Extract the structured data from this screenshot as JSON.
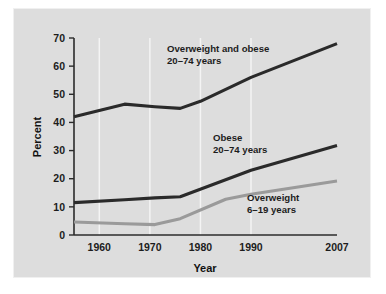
{
  "figure": {
    "background_color": "#ffffff",
    "panel_color": "#dddddd"
  },
  "chart_data": {
    "type": "line",
    "title": "",
    "xlabel": "Year",
    "ylabel": "Percent",
    "xlim": [
      1955,
      2007
    ],
    "ylim": [
      0,
      70
    ],
    "grid": "vertical",
    "legend": "inline-annotations",
    "xticks": [
      1960,
      1970,
      1980,
      1990,
      2007
    ],
    "xticklabels": [
      "1960",
      "1970",
      "1980",
      "1990",
      "2007"
    ],
    "yticks": [
      0,
      10,
      20,
      30,
      40,
      50,
      60,
      70
    ],
    "yticklabels": [
      "0",
      "10",
      "20",
      "30",
      "40",
      "50",
      "60",
      "70"
    ],
    "gridlines_x": [
      1960,
      1970,
      1980,
      1990
    ],
    "series": [
      {
        "name": "Overweight and obese 20-74 years",
        "color": "#2a2a2a",
        "x": [
          1955,
          1965,
          1971,
          1976,
          1980,
          1990,
          2007
        ],
        "values": [
          42.0,
          46.5,
          45.6,
          45.0,
          47.5,
          56.0,
          68.0
        ]
      },
      {
        "name": "Obese 20-74 years",
        "color": "#2a2a2a",
        "x": [
          1955,
          1965,
          1971,
          1976,
          1990,
          2007
        ],
        "values": [
          11.5,
          12.5,
          13.2,
          13.6,
          23.0,
          31.8
        ]
      },
      {
        "name": "Overweight 6-19 years",
        "color": "#9a9a9a",
        "x": [
          1955,
          1965,
          1971,
          1976,
          1985,
          1990,
          2007
        ],
        "values": [
          4.6,
          4.0,
          3.7,
          5.8,
          12.7,
          14.5,
          19.2
        ]
      }
    ],
    "annotations": [
      {
        "id": "overweight-and-obese",
        "line1": "Overweight and obese",
        "line2": "20–74 years",
        "x": 167,
        "y": 52
      },
      {
        "id": "obese",
        "line1": "Obese",
        "line2": "20–74 years",
        "x": 213,
        "y": 141
      },
      {
        "id": "overweight",
        "line1": "Overweight",
        "line2": "6–19 years",
        "x": 247,
        "y": 201
      }
    ]
  }
}
